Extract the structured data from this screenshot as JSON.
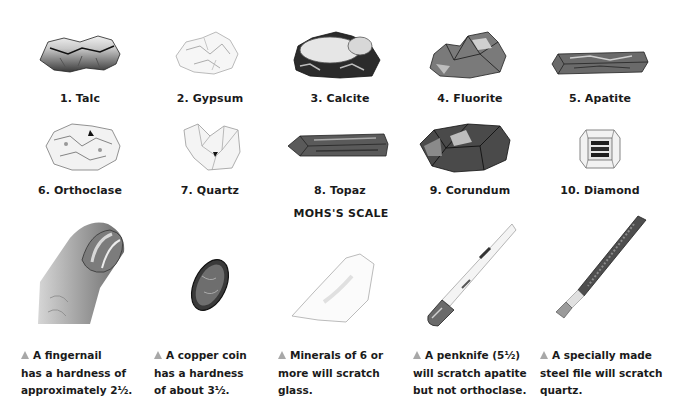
{
  "title": "MOHS'S SCALE",
  "minerals": [
    {
      "label": "1. Talc",
      "hardness": 1
    },
    {
      "label": "2. Gypsum",
      "hardness": 2
    },
    {
      "label": "3. Calcite",
      "hardness": 3
    },
    {
      "label": "4. Fluorite",
      "hardness": 4
    },
    {
      "label": "5. Apatite",
      "hardness": 5
    },
    {
      "label": "6. Orthoclase",
      "hardness": 6
    },
    {
      "label": "7. Quartz",
      "hardness": 7
    },
    {
      "label": "8. Topaz",
      "hardness": 8
    },
    {
      "label": "9. Corundum",
      "hardness": 9
    },
    {
      "label": "10. Diamond",
      "hardness": 10
    }
  ],
  "tools": [
    {
      "name": "fingernail",
      "lines": [
        "A fingernail",
        "has a hardness of",
        "approximately 2½."
      ]
    },
    {
      "name": "copper coin",
      "lines": [
        "A copper coin",
        "has a hardness",
        "of about 3½."
      ]
    },
    {
      "name": "glass",
      "lines": [
        "Minerals of 6 or",
        "more will scratch",
        "glass."
      ]
    },
    {
      "name": "penknife",
      "lines": [
        "A penknife (5½)",
        "will scratch apatite",
        "but not orthoclase."
      ]
    },
    {
      "name": "steel file",
      "lines": [
        "A specially made",
        "steel file will scratch",
        "quartz."
      ]
    }
  ],
  "colors": {
    "bullet": "#a8a8a8",
    "text": "#1a1a1a",
    "background": "#ffffff"
  }
}
